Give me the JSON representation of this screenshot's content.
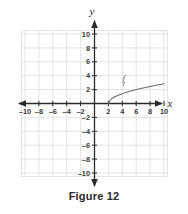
{
  "figure": {
    "caption": "Figure 12",
    "axis_labels": {
      "x": "x",
      "y": "y"
    },
    "curve_label": "f"
  },
  "colors": {
    "grid": "#d8d8d8",
    "axis": "#2b2b2b",
    "curve": "#6b6b6b",
    "text": "#3c3c3c",
    "background": "#ffffff"
  },
  "chart_data": {
    "type": "line",
    "title": "Figure 12",
    "xlabel": "x",
    "ylabel": "y",
    "grid": true,
    "legend": "none",
    "xlim": [
      -12,
      12
    ],
    "ylim": [
      -12,
      12
    ],
    "xticks": [
      -10,
      -8,
      -6,
      -4,
      -2,
      2,
      4,
      6,
      8,
      10
    ],
    "yticks": [
      -10,
      -8,
      -6,
      -4,
      -2,
      2,
      4,
      6,
      8,
      10
    ],
    "xtick_labels": [
      "-10",
      "-8",
      "-6",
      "-4",
      "-2",
      "2",
      "4",
      "6",
      "8",
      "10"
    ],
    "ytick_labels": [
      "-10",
      "-8",
      "-6",
      "-4",
      "-2",
      "2",
      "4",
      "6",
      "8",
      "10"
    ],
    "series": [
      {
        "name": "f",
        "label": "f",
        "description": "increasing square-root shaped curve beginning at (2, 0)",
        "x": [
          2,
          2.25,
          2.5,
          3,
          3.5,
          4,
          4.5,
          5,
          5.5,
          6,
          6.5,
          7,
          7.5,
          8,
          8.5,
          9,
          9.5,
          10
        ],
        "y": [
          0,
          0.5,
          0.71,
          1.0,
          1.22,
          1.41,
          1.58,
          1.73,
          1.87,
          2.0,
          2.12,
          2.24,
          2.35,
          2.45,
          2.55,
          2.65,
          2.74,
          2.83
        ]
      }
    ],
    "annotations": [
      {
        "text": "f",
        "x": 4.2,
        "y": 3.3
      }
    ]
  },
  "ticks": {
    "x": [
      {
        "value": -10,
        "label": "-10"
      },
      {
        "value": -8,
        "label": "-8"
      },
      {
        "value": -6,
        "label": "-6"
      },
      {
        "value": -4,
        "label": "-4"
      },
      {
        "value": -2,
        "label": "-2"
      },
      {
        "value": 2,
        "label": "2"
      },
      {
        "value": 4,
        "label": "4"
      },
      {
        "value": 6,
        "label": "6"
      },
      {
        "value": 8,
        "label": "8"
      },
      {
        "value": 10,
        "label": "10"
      }
    ],
    "y": [
      {
        "value": 10,
        "label": "10"
      },
      {
        "value": 8,
        "label": "8"
      },
      {
        "value": 6,
        "label": "6"
      },
      {
        "value": 4,
        "label": "4"
      },
      {
        "value": 2,
        "label": "2"
      },
      {
        "value": -2,
        "label": "-2"
      },
      {
        "value": -4,
        "label": "-4"
      },
      {
        "value": -6,
        "label": "-6"
      },
      {
        "value": -8,
        "label": "-8"
      },
      {
        "value": -10,
        "label": "-10"
      }
    ]
  }
}
